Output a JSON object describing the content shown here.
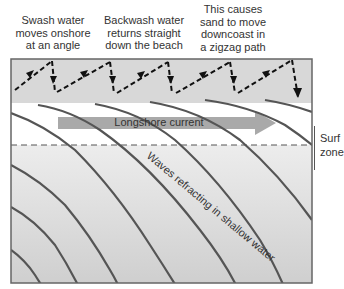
{
  "captions": [
    {
      "lines": [
        "Swash water",
        "moves onshore",
        "at an angle"
      ]
    },
    {
      "lines": [
        "Backwash water",
        "returns straight",
        "down the beach"
      ]
    },
    {
      "lines": [
        "This causes",
        "sand to move",
        "downcoast in",
        "a zigzag path"
      ]
    }
  ],
  "labels": {
    "longshore_current": "Longshore current",
    "waves": "Waves refracting in shallow water",
    "surf_zone_line1": "Surf",
    "surf_zone_line2": "zone"
  },
  "colors": {
    "beach": "#d8d8d8",
    "wave_line": "#555555",
    "arrow": "#9a9a9a",
    "frame": "#666666",
    "path": "#111111"
  }
}
